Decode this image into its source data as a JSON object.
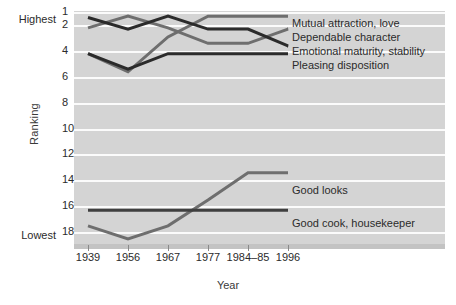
{
  "chart_data": {
    "type": "line",
    "title": "",
    "xlabel": "Year",
    "ylabel": "Ranking",
    "categories": [
      "1939",
      "1956",
      "1967",
      "1977",
      "1984–85",
      "1996"
    ],
    "x_ticks": [
      "1939",
      "1956",
      "1967",
      "1977",
      "1984–85",
      "1996"
    ],
    "y_ticks": [
      "1",
      "2",
      "4",
      "6",
      "8",
      "10",
      "12",
      "14",
      "16",
      "18"
    ],
    "y_tick_values": [
      1,
      2,
      4,
      6,
      8,
      10,
      12,
      14,
      16,
      18
    ],
    "ylim": [
      1,
      19
    ],
    "y_axis_high_label": "Highest",
    "y_axis_low_label": "Lowest",
    "y_axis_inverted": true,
    "grid": true,
    "grid_axis": "y",
    "legend_position": "right-inline",
    "series": [
      {
        "name": "Mutual attraction, love",
        "color": "#6e6e6e",
        "values": [
          4.3,
          5.7,
          3.0,
          1.4,
          1.4,
          1.4
        ],
        "label_x": 292,
        "label_y": 18
      },
      {
        "name": "Dependable character",
        "color": "#6e6e6e",
        "values": [
          2.3,
          1.4,
          2.3,
          3.5,
          3.5,
          2.4
        ],
        "label_x": 292,
        "label_y": 32
      },
      {
        "name": "Emotional maturity, stability",
        "color": "#2b2b2b",
        "values": [
          1.5,
          2.4,
          1.4,
          2.4,
          2.4,
          3.7
        ],
        "label_x": 292,
        "label_y": 46
      },
      {
        "name": "Pleasing disposition",
        "color": "#2b2b2b",
        "values": [
          4.3,
          5.5,
          4.3,
          4.3,
          4.3,
          4.3
        ],
        "label_x": 292,
        "label_y": 60
      },
      {
        "name": "Good looks",
        "color": "#6e6e6e",
        "values": [
          17.6,
          18.6,
          17.6,
          15.6,
          13.5,
          13.5
        ],
        "label_x": 292,
        "label_y": 185
      },
      {
        "name": "Good cook, housekeeper",
        "color": "#3f3f3f",
        "values": [
          16.4,
          16.4,
          16.4,
          16.4,
          16.4,
          16.4
        ],
        "label_x": 292,
        "label_y": 218
      }
    ]
  },
  "axes": {
    "y_title": "Ranking",
    "x_title": "Year",
    "highest": "Highest",
    "lowest": "Lowest"
  },
  "colors": {
    "plot_background": "#d4d4d4",
    "gridline": "#fbfbfb",
    "dark_series": "#2b2b2b",
    "gray_series": "#6e6e6e",
    "text": "#2b2b2b"
  }
}
